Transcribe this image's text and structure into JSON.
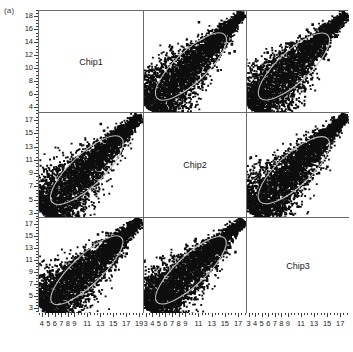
{
  "figure": {
    "panel_tag": "(a)",
    "diagonal_labels": [
      "Chip1",
      "Chip2",
      "Chip3"
    ]
  },
  "chart_data": {
    "type": "scatter",
    "title": "(a)",
    "subtitle": "",
    "xlabel": "",
    "ylabel": "",
    "layout": "scatterplot-matrix",
    "grid_rows": 3,
    "grid_cols": 3,
    "variables": [
      "Chip1",
      "Chip2",
      "Chip3"
    ],
    "grid": false,
    "legend": "none",
    "point_color": "#0d0d0d",
    "ellipse_color": "#b9b9b9",
    "frame_color": "#6a6a6a",
    "diagonal_panels": [
      {
        "row": 1,
        "col": 1,
        "label": "Chip1"
      },
      {
        "row": 2,
        "col": 2,
        "label": "Chip2"
      },
      {
        "row": 3,
        "col": 3,
        "label": "Chip3"
      }
    ],
    "rows": [
      {
        "row": 1,
        "y_variable": "Chip1",
        "ylim": [
          3.2,
          19.0
        ],
        "yticks": [
          4,
          6,
          8,
          10,
          12,
          14,
          16,
          18
        ],
        "ytick_labels": [
          "4",
          "6",
          "8",
          "10",
          "12",
          "14",
          "16",
          "18"
        ],
        "panels": [
          {
            "col": 1,
            "kind": "label",
            "label": "Chip1"
          },
          {
            "col": 2,
            "kind": "scatter",
            "x_variable": "Chip2",
            "y_variable": "Chip1",
            "n_points": 4200,
            "correlation": 0.96,
            "cloud": "teardrop",
            "ellipse": true
          },
          {
            "col": 3,
            "kind": "scatter",
            "x_variable": "Chip3",
            "y_variable": "Chip1",
            "n_points": 4200,
            "correlation": 0.95,
            "cloud": "teardrop",
            "ellipse": true
          }
        ]
      },
      {
        "row": 2,
        "y_variable": "Chip2",
        "ylim": [
          2.4,
          18.2
        ],
        "yticks": [
          3,
          5,
          7,
          9,
          11,
          13,
          15,
          17
        ],
        "ytick_labels": [
          "3",
          "5",
          "7",
          "9",
          "11",
          "13",
          "15",
          "17"
        ],
        "panels": [
          {
            "col": 1,
            "kind": "scatter",
            "x_variable": "Chip1",
            "y_variable": "Chip2",
            "n_points": 4200,
            "correlation": 0.96,
            "cloud": "teardrop",
            "ellipse": true
          },
          {
            "col": 2,
            "kind": "label",
            "label": "Chip2"
          },
          {
            "col": 3,
            "kind": "scatter",
            "x_variable": "Chip3",
            "y_variable": "Chip2",
            "n_points": 4200,
            "correlation": 0.96,
            "cloud": "teardrop",
            "ellipse": true
          }
        ]
      },
      {
        "row": 3,
        "y_variable": "Chip3",
        "ylim": [
          2.4,
          18.2
        ],
        "yticks": [
          3,
          5,
          7,
          9,
          11,
          13,
          15,
          17
        ],
        "ytick_labels": [
          "3",
          "5",
          "7",
          "9",
          "11",
          "13",
          "15",
          "17"
        ],
        "panels": [
          {
            "col": 1,
            "kind": "scatter",
            "x_variable": "Chip1",
            "y_variable": "Chip3",
            "n_points": 4200,
            "correlation": 0.94,
            "cloud": "teardrop",
            "ellipse": true
          },
          {
            "col": 2,
            "kind": "scatter",
            "x_variable": "Chip2",
            "y_variable": "Chip3",
            "n_points": 4200,
            "correlation": 0.95,
            "cloud": "teardrop",
            "ellipse": true
          },
          {
            "col": 3,
            "kind": "label",
            "label": "Chip3"
          }
        ]
      }
    ],
    "columns": [
      {
        "col": 1,
        "x_variable": "Chip1",
        "xlim": [
          3.4,
          19.6
        ],
        "xticks": [
          4,
          5,
          6,
          7,
          8,
          9,
          11,
          13,
          15,
          17,
          19
        ],
        "xtick_labels": [
          "4",
          "5",
          "6",
          "7",
          "8",
          "9",
          "11",
          "13",
          "15",
          "17",
          "19"
        ]
      },
      {
        "col": 2,
        "x_variable": "Chip2",
        "xlim": [
          2.6,
          18.2
        ],
        "xticks": [
          3,
          4,
          5,
          6,
          7,
          8,
          9,
          11,
          13,
          15,
          17
        ],
        "xtick_labels": [
          "3",
          "4",
          "5",
          "6",
          "7",
          "8",
          "9",
          "11",
          "13",
          "15",
          "17"
        ]
      },
      {
        "col": 3,
        "x_variable": "Chip3",
        "xlim": [
          2.6,
          18.2
        ],
        "xticks": [
          3,
          4,
          5,
          6,
          7,
          8,
          9,
          11,
          13,
          15,
          17
        ],
        "xtick_labels": [
          "3",
          "4",
          "5",
          "6",
          "7",
          "8",
          "9",
          "11",
          "13",
          "15",
          "17"
        ]
      }
    ]
  }
}
